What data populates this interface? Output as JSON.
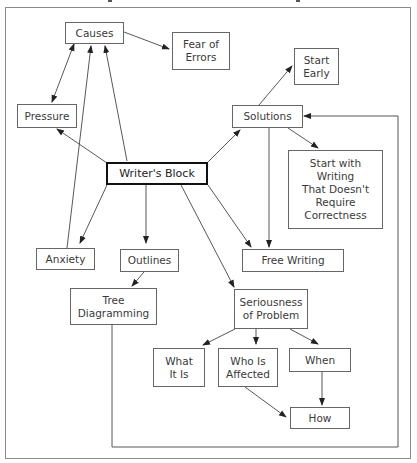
{
  "diagram": {
    "central": "Writer's Block",
    "nodes": {
      "causes": "Causes",
      "fear_of_errors": "Fear of\nErrors",
      "pressure": "Pressure",
      "anxiety": "Anxiety",
      "outlines": "Outlines",
      "tree_diagramming": "Tree\nDiagramming",
      "solutions": "Solutions",
      "start_early": "Start\nEarly",
      "start_with_writing": "Start with\nWriting\nThat Doesn't\nRequire\nCorrectness",
      "free_writing": "Free Writing",
      "seriousness": "Seriousness\nof Problem",
      "what_it_is": "What\nIt Is",
      "who_is_affected": "Who Is\nAffected",
      "when": "When",
      "how": "How"
    },
    "colors": {
      "line": "#444444",
      "frame": "#8a8a8a",
      "central_border": "#111111"
    }
  }
}
